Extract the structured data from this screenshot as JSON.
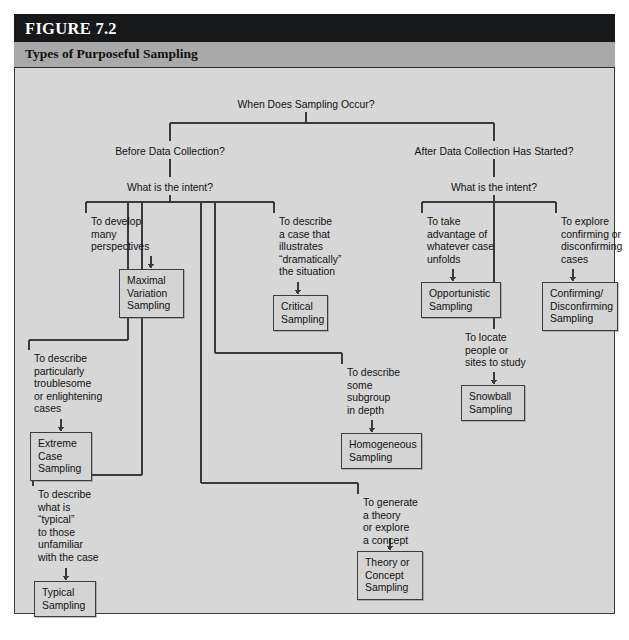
{
  "figure": {
    "number_label": "FIGURE 7.2",
    "title": "Types of Purposeful Sampling",
    "colors": {
      "header_bg": "#17181a",
      "subheader_bg": "#a9a9a9",
      "body_bg": "#d7d7d7",
      "line": "#3a3a3a",
      "box_fill": "#d4d4d4",
      "text": "#121212"
    }
  },
  "diagram": {
    "type": "tree-flowchart",
    "root": {
      "label": "When Does Sampling Occur?"
    },
    "branches": [
      {
        "id": "before",
        "label": "Before Data Collection?",
        "question": "What is the intent?",
        "children": [
          {
            "id": "maximal-variation",
            "rationale": "To develop\nmany\nperspectives",
            "term": "Maximal\nVariation\nSampling"
          },
          {
            "id": "critical",
            "rationale": "To describe\na case that\nillustrates\n“dramatically”\nthe situation",
            "term": "Critical\nSampling"
          },
          {
            "id": "extreme-case",
            "rationale": "To describe\nparticularly\ntroublesome\nor enlightening\ncases",
            "term": "Extreme\nCase\nSampling"
          },
          {
            "id": "homogeneous",
            "rationale": "To describe\nsome\nsubgroup\nin depth",
            "term": "Homogeneous\nSampling"
          },
          {
            "id": "typical",
            "rationale": "To describe\nwhat is\n“typical”\nto those\nunfamiliar\nwith the case",
            "term": "Typical\nSampling"
          },
          {
            "id": "theory-concept",
            "rationale": "To generate\na theory\nor explore\na concept",
            "term": "Theory or\nConcept\nSampling"
          }
        ]
      },
      {
        "id": "after",
        "label": "After Data Collection Has Started?",
        "question": "What is the intent?",
        "children": [
          {
            "id": "opportunistic",
            "rationale": "To take\nadvantage of\nwhatever case\nunfolds",
            "term": "Opportunistic\nSampling"
          },
          {
            "id": "confirming-disconfirming",
            "rationale": "To explore\nconfirming or\ndisconfirming\ncases",
            "term": "Confirming/\nDisconfirming\nSampling"
          },
          {
            "id": "snowball",
            "rationale": "To locate\npeople or\nsites to study",
            "term": "Snowball\nSampling"
          }
        ]
      }
    ]
  }
}
